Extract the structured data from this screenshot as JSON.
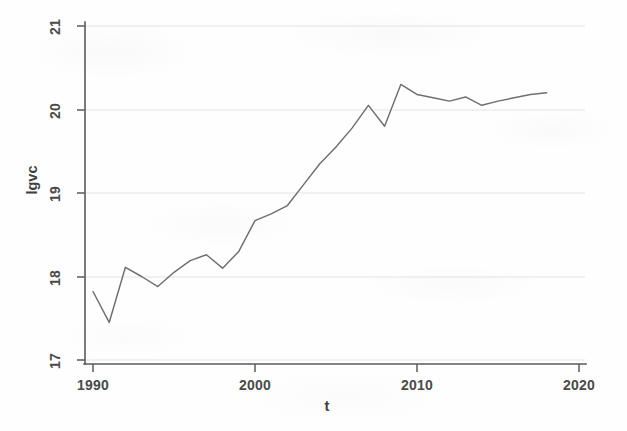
{
  "figure": {
    "background_color": "#fefefe",
    "line_color": "#6e6e74",
    "axis_color": "#5a5a5a",
    "grid_color": "#d8d8dc"
  },
  "axes": {
    "x_title": "t",
    "y_title": "lgvc",
    "x_ticks": [
      "1990",
      "2000",
      "2010",
      "2020"
    ],
    "y_ticks": [
      "17",
      "18",
      "19",
      "20",
      "21"
    ]
  },
  "chart_data": {
    "type": "line",
    "title": "",
    "xlabel": "t",
    "ylabel": "lgvc",
    "xlim": [
      1990,
      2020
    ],
    "ylim": [
      17,
      21
    ],
    "xticks": [
      1990,
      2000,
      2010,
      2020
    ],
    "yticks": [
      17,
      18,
      19,
      20,
      21
    ],
    "grid": true,
    "grid_axis": "y",
    "legend": false,
    "series": [
      {
        "name": "lgvc",
        "x": [
          1990,
          1991,
          1992,
          1993,
          1994,
          1995,
          1996,
          1997,
          1998,
          1999,
          2000,
          2001,
          2002,
          2003,
          2004,
          2005,
          2006,
          2007,
          2008,
          2009,
          2010,
          2011,
          2012,
          2013,
          2014,
          2015,
          2016,
          2017,
          2018
        ],
        "values": [
          17.82,
          17.45,
          18.11,
          18.0,
          17.88,
          18.05,
          18.19,
          18.26,
          18.1,
          18.3,
          18.67,
          18.75,
          18.85,
          19.1,
          19.35,
          19.55,
          19.78,
          20.05,
          19.8,
          20.3,
          20.18,
          20.14,
          20.1,
          20.15,
          20.05,
          20.1,
          20.14,
          20.18,
          20.2
        ]
      }
    ]
  }
}
